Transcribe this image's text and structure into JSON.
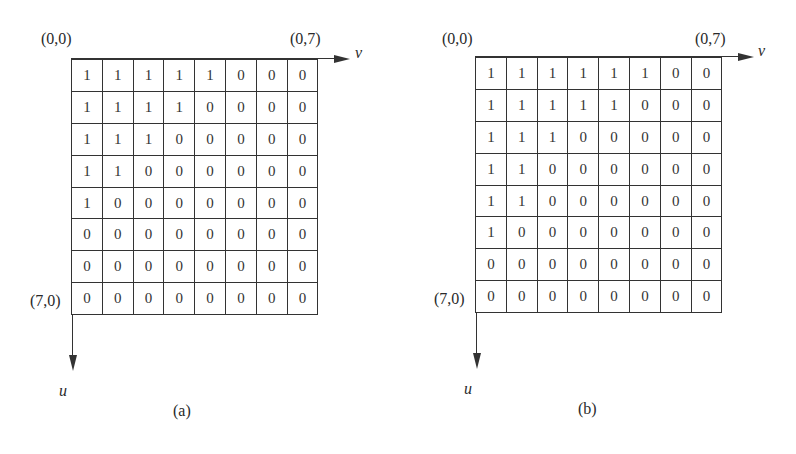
{
  "panels": [
    {
      "caption": "(a)",
      "origin_label": "(0,0)",
      "top_right_label": "(0,7)",
      "bottom_left_label": "(7,0)",
      "h_axis_label": "v",
      "v_axis_label": "u",
      "matrix": [
        [
          "1",
          "1",
          "1",
          "1",
          "1",
          "0",
          "0",
          "0"
        ],
        [
          "1",
          "1",
          "1",
          "1",
          "0",
          "0",
          "0",
          "0"
        ],
        [
          "1",
          "1",
          "1",
          "0",
          "0",
          "0",
          "0",
          "0"
        ],
        [
          "1",
          "1",
          "0",
          "0",
          "0",
          "0",
          "0",
          "0"
        ],
        [
          "1",
          "0",
          "0",
          "0",
          "0",
          "0",
          "0",
          "0"
        ],
        [
          "0",
          "0",
          "0",
          "0",
          "0",
          "0",
          "0",
          "0"
        ],
        [
          "0",
          "0",
          "0",
          "0",
          "0",
          "0",
          "0",
          "0"
        ],
        [
          "0",
          "0",
          "0",
          "0",
          "0",
          "0",
          "0",
          "0"
        ]
      ]
    },
    {
      "caption": "(b)",
      "origin_label": "(0,0)",
      "top_right_label": "(0,7)",
      "bottom_left_label": "(7,0)",
      "h_axis_label": "v",
      "v_axis_label": "u",
      "matrix": [
        [
          "1",
          "1",
          "1",
          "1",
          "1",
          "1",
          "0",
          "0"
        ],
        [
          "1",
          "1",
          "1",
          "1",
          "1",
          "0",
          "0",
          "0"
        ],
        [
          "1",
          "1",
          "1",
          "0",
          "0",
          "0",
          "0",
          "0"
        ],
        [
          "1",
          "1",
          "0",
          "0",
          "0",
          "0",
          "0",
          "0"
        ],
        [
          "1",
          "1",
          "0",
          "0",
          "0",
          "0",
          "0",
          "0"
        ],
        [
          "1",
          "0",
          "0",
          "0",
          "0",
          "0",
          "0",
          "0"
        ],
        [
          "0",
          "0",
          "0",
          "0",
          "0",
          "0",
          "0",
          "0"
        ],
        [
          "0",
          "0",
          "0",
          "0",
          "0",
          "0",
          "0",
          "0"
        ]
      ]
    }
  ]
}
